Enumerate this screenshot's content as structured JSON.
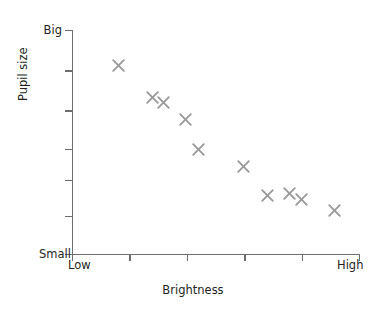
{
  "chart_data": {
    "type": "scatter",
    "title": "",
    "xlabel": "Brightness",
    "ylabel": "Pupil size",
    "grid": false,
    "legend": null,
    "x_axis": {
      "min_label": "Low",
      "max_label": "High",
      "range": [
        0,
        1
      ],
      "tick_count": 6,
      "ticks_normalized": [
        0.0,
        0.2,
        0.4,
        0.6,
        0.8,
        1.0
      ]
    },
    "y_axis": {
      "min_label": "Small",
      "max_label": "Big",
      "range": [
        0,
        1
      ],
      "tick_count": 7,
      "ticks_normalized": [
        0.0,
        0.17,
        0.33,
        0.47,
        0.64,
        0.82,
        1.0
      ]
    },
    "marker_symbol": "x",
    "marker_color": "#9a9a9a",
    "axis_color": "#6e6e6e",
    "text_color": "#231f20",
    "points": [
      {
        "x": 0.161,
        "y": 0.839
      },
      {
        "x": 0.28,
        "y": 0.7
      },
      {
        "x": 0.318,
        "y": 0.674
      },
      {
        "x": 0.395,
        "y": 0.598
      },
      {
        "x": 0.44,
        "y": 0.464
      },
      {
        "x": 0.597,
        "y": 0.388
      },
      {
        "x": 0.681,
        "y": 0.259
      },
      {
        "x": 0.758,
        "y": 0.268
      },
      {
        "x": 0.8,
        "y": 0.241
      },
      {
        "x": 0.915,
        "y": 0.192
      }
    ]
  },
  "labels": {
    "y_big": "Big",
    "y_small": "Small",
    "x_low": "Low",
    "x_high": "High",
    "x_title": "Brightness",
    "y_title": "Pupil size"
  }
}
